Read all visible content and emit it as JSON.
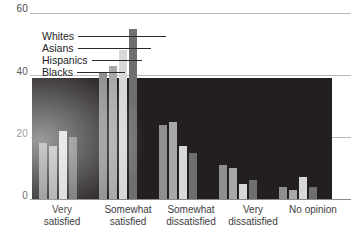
{
  "chart_data": {
    "type": "bar",
    "title": "",
    "xlabel": "",
    "ylabel": "",
    "ylim": [
      0,
      60
    ],
    "yticks": [
      0,
      20,
      40,
      60
    ],
    "ytick_labels": [
      "0",
      "20",
      "40",
      "60"
    ],
    "grid": true,
    "legend_position": "upper-left-inset",
    "categories": [
      "Very satisfied",
      "Somewhat satisfied",
      "Somewhat dissatisfied",
      "Very dissatisfied",
      "No opinion"
    ],
    "series": [
      {
        "name": "Blacks",
        "values": [
          18,
          41,
          24,
          11,
          4
        ]
      },
      {
        "name": "Hispanics",
        "values": [
          17,
          43,
          25,
          10,
          3
        ]
      },
      {
        "name": "Asians",
        "values": [
          22,
          48,
          17,
          5,
          7
        ]
      },
      {
        "name": "Whites",
        "values": [
          20,
          55,
          15,
          6,
          4
        ]
      }
    ],
    "colors": {
      "Blacks": "#8f8f8f",
      "Hispanics": "#a8a8a8",
      "Asians": "#d8d8d8",
      "Whites": "#6f6f6f",
      "plot_background": "#231f20",
      "gridline": "#b9b9b9",
      "text": "#3c3c3c"
    }
  },
  "axis": {
    "y_labels": [
      "60",
      "40",
      "20",
      "0"
    ]
  },
  "legend": {
    "items": [
      {
        "label": "Whites"
      },
      {
        "label": "Asians"
      },
      {
        "label": "Hispanics"
      },
      {
        "label": "Blacks"
      }
    ]
  },
  "x_categories": [
    {
      "line1": "Very",
      "line2": "satisfied"
    },
    {
      "line1": "Somewhat",
      "line2": "satisfied"
    },
    {
      "line1": "Somewhat",
      "line2": "dissatisfied"
    },
    {
      "line1": "Very",
      "line2": "dissatisfied"
    },
    {
      "line1": "No opinion",
      "line2": ""
    }
  ]
}
